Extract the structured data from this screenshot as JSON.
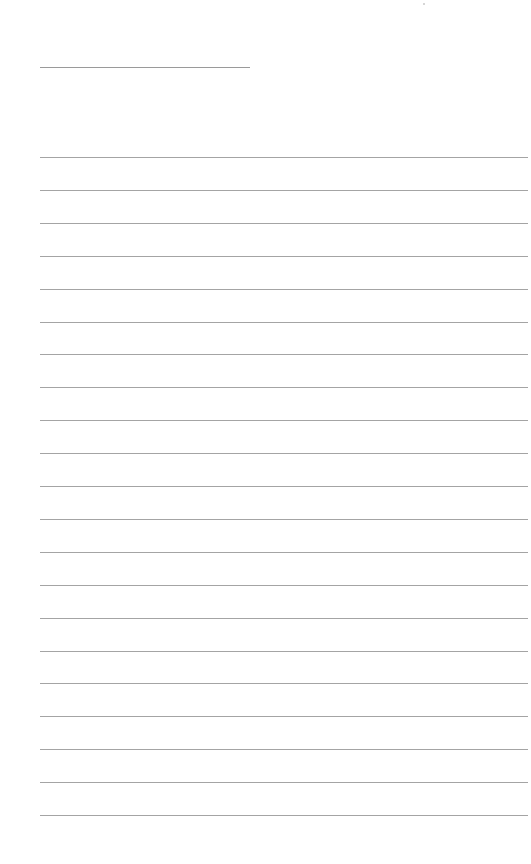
{
  "document": {
    "type": "blank ruled sheet",
    "header_line": {
      "x": 40,
      "y": 67,
      "length": 210
    },
    "ruled_lines": {
      "count": 21,
      "x": 40,
      "first_y": 157,
      "spacing": 32.9,
      "length": 488
    },
    "colors": {
      "background": "#ffffff",
      "line": "#a4a4a4"
    }
  }
}
